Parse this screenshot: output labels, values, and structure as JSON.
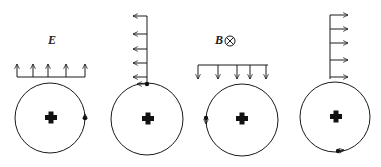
{
  "diagram": {
    "labels": {
      "electric_field": "E",
      "magnetic_field": "B",
      "magnetic_direction_symbol": "into-page"
    },
    "colors": {
      "stroke": "#1a1a1a",
      "background": "#ffffff"
    },
    "panels": [
      {
        "index": 1,
        "field_arrows": "up",
        "field_label": "E",
        "charge_position": "right",
        "charge_motion": "up"
      },
      {
        "index": 2,
        "field_arrows": "left",
        "field_label": "",
        "charge_position": "top",
        "charge_motion": "left"
      },
      {
        "index": 3,
        "field_arrows": "down",
        "field_label": "B",
        "charge_position": "left",
        "charge_motion": "down"
      },
      {
        "index": 4,
        "field_arrows": "right",
        "field_label": "",
        "charge_position": "bottom",
        "charge_motion": "right"
      }
    ],
    "nucleus_symbol": "+"
  }
}
